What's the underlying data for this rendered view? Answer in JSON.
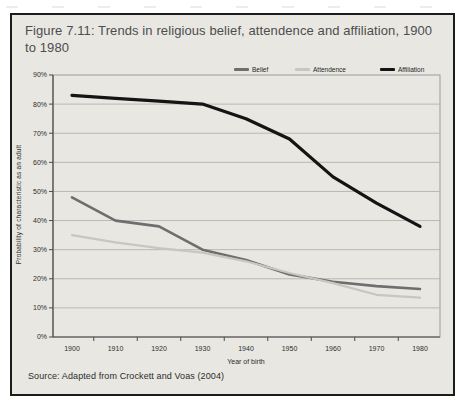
{
  "figure": {
    "title": "Figure 7.11: Trends in religious belief, attendence and affiliation, 1900 to 1980",
    "source": "Source: Adapted from Crockett and Voas (2004)"
  },
  "chart_data": {
    "type": "line",
    "title": "Figure 7.11: Trends in religious belief, attendence and affiliation, 1900 to 1980",
    "categories": [
      "1900",
      "1910",
      "1920",
      "1930",
      "1940",
      "1950",
      "1960",
      "1970",
      "1980"
    ],
    "series": [
      {
        "name": "Belief",
        "color": "#6e6e6e",
        "stroke_width": 2.6,
        "values": [
          48,
          40,
          38,
          30,
          26.5,
          21.5,
          19,
          17.5,
          16.5
        ]
      },
      {
        "name": "Attendence",
        "color": "#c7c6c1",
        "stroke_width": 2.2,
        "values": [
          35,
          32.5,
          30.5,
          29,
          26,
          22,
          18.5,
          14.5,
          13.5
        ]
      },
      {
        "name": "Affiliation",
        "color": "#141414",
        "stroke_width": 3.2,
        "values": [
          83,
          82,
          81,
          80,
          75,
          68,
          55,
          46,
          38
        ]
      }
    ],
    "xlabel": "Year of birth",
    "ylabel": "Probability of characteristic as an adult",
    "ylim": [
      0,
      90
    ],
    "y_tick_step": 10,
    "y_tick_suffix": "%",
    "grid": true,
    "legend_position": "top",
    "source": "Source: Adapted from Crockett and Voas (2004)"
  },
  "style": {
    "background": "#e8e7e2",
    "border": "#1c1c1c",
    "gridline": "#b3b2ae",
    "axis": "#4a4a4a",
    "plot_frame": "#9c9b97",
    "tick_label": "#2e2e2e",
    "title_color": "#4d4d4d"
  }
}
